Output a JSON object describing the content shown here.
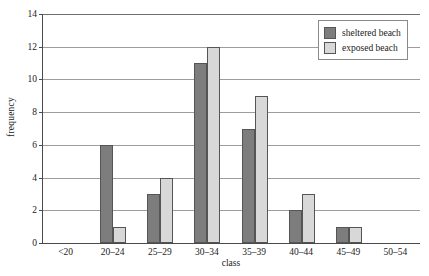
{
  "chart_data": {
    "type": "bar",
    "title": "",
    "subtitle": "",
    "xlabel": "class",
    "ylabel": "frequency",
    "categories": [
      "<20",
      "20–24",
      "25–29",
      "30–34",
      "35–39",
      "40–44",
      "45–49",
      "50–54"
    ],
    "series": [
      {
        "name": "sheltered beach",
        "color": "#7d7d7d",
        "values": [
          0,
          6,
          3,
          11,
          7,
          2,
          1,
          0
        ]
      },
      {
        "name": "exposed beach",
        "color": "#d8d8d8",
        "values": [
          0,
          1,
          4,
          12,
          9,
          3,
          1,
          0
        ]
      }
    ],
    "ylim": [
      0,
      14
    ],
    "ytick_step": 2,
    "yticks": [
      0,
      2,
      4,
      6,
      8,
      10,
      12,
      14
    ],
    "ytick_labels": [
      "0",
      "2",
      "4",
      "6",
      "8",
      "10",
      "12",
      "14"
    ],
    "grid": true,
    "grid_axis": "y",
    "legend_position": "top-right",
    "bar_grouping": "grouped",
    "background_color": "#ffffff",
    "axis_color": "#4a4a4a",
    "gridline_color": "#9d9d9d",
    "bar_border_color": "#555555"
  }
}
